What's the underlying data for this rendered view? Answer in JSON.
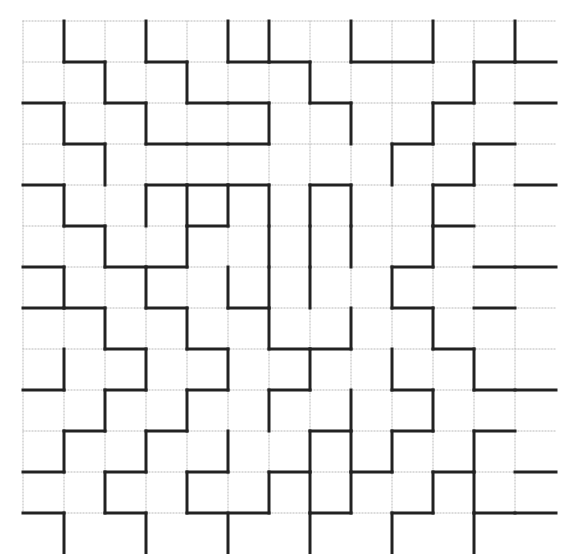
{
  "figure": {
    "kind": "maze-grid-pattern",
    "title": "",
    "caption": "",
    "background_color": "#ffffff",
    "wall_color": "#222222",
    "grid_color": "#b9b9b9",
    "wall_width": 3,
    "grid_width": 1,
    "grid_dash": "1,2"
  },
  "geometry": {
    "origin_x": 23,
    "origin_y": 21,
    "cell": 41,
    "cols": 12,
    "rows": 12,
    "width": 574,
    "height": 554
  },
  "grid_lines": {
    "vertical_x": [
      23,
      64,
      105,
      146,
      187,
      228,
      269,
      310,
      351,
      392,
      433,
      474,
      515
    ],
    "horizontal_y": [
      21,
      62,
      103,
      144,
      185,
      226,
      267,
      308,
      349,
      390,
      431,
      472,
      513
    ]
  },
  "walls": {
    "note": "Each segment is [x1,y1,x2,y2] in pixel coordinates; thick dark strokes forming the maze.",
    "segments": [
      [
        64,
        21,
        64,
        62
      ],
      [
        146,
        21,
        146,
        62
      ],
      [
        228,
        21,
        228,
        62
      ],
      [
        269,
        21,
        269,
        62
      ],
      [
        351,
        21,
        351,
        62
      ],
      [
        433,
        21,
        433,
        62
      ],
      [
        515,
        21,
        515,
        62
      ],
      [
        64,
        62,
        105,
        62
      ],
      [
        146,
        62,
        187,
        62
      ],
      [
        228,
        62,
        269,
        62
      ],
      [
        269,
        62,
        310,
        62
      ],
      [
        351,
        62,
        433,
        62
      ],
      [
        474,
        62,
        515,
        62
      ],
      [
        515,
        62,
        556,
        62
      ],
      [
        105,
        62,
        105,
        103
      ],
      [
        187,
        62,
        187,
        103
      ],
      [
        310,
        62,
        310,
        103
      ],
      [
        474,
        62,
        474,
        103
      ],
      [
        23,
        103,
        64,
        103
      ],
      [
        105,
        103,
        146,
        103
      ],
      [
        187,
        103,
        228,
        103
      ],
      [
        228,
        103,
        269,
        103
      ],
      [
        310,
        103,
        351,
        103
      ],
      [
        433,
        103,
        474,
        103
      ],
      [
        515,
        103,
        556,
        103
      ],
      [
        64,
        103,
        64,
        144
      ],
      [
        146,
        103,
        146,
        144
      ],
      [
        269,
        103,
        269,
        144
      ],
      [
        351,
        103,
        351,
        144
      ],
      [
        433,
        103,
        433,
        144
      ],
      [
        64,
        144,
        105,
        144
      ],
      [
        146,
        144,
        187,
        144
      ],
      [
        187,
        144,
        228,
        144
      ],
      [
        228,
        144,
        269,
        144
      ],
      [
        392,
        144,
        433,
        144
      ],
      [
        474,
        144,
        515,
        144
      ],
      [
        105,
        144,
        105,
        185
      ],
      [
        392,
        144,
        392,
        185
      ],
      [
        474,
        144,
        474,
        185
      ],
      [
        23,
        185,
        64,
        185
      ],
      [
        146,
        185,
        187,
        185
      ],
      [
        187,
        185,
        228,
        185
      ],
      [
        228,
        185,
        269,
        185
      ],
      [
        310,
        185,
        351,
        185
      ],
      [
        433,
        185,
        474,
        185
      ],
      [
        515,
        185,
        556,
        185
      ],
      [
        64,
        185,
        64,
        226
      ],
      [
        146,
        185,
        146,
        226
      ],
      [
        269,
        185,
        269,
        226
      ],
      [
        310,
        185,
        310,
        226
      ],
      [
        351,
        185,
        351,
        226
      ],
      [
        433,
        185,
        433,
        226
      ],
      [
        187,
        185,
        187,
        226
      ],
      [
        228,
        185,
        228,
        226
      ],
      [
        64,
        226,
        105,
        226
      ],
      [
        187,
        226,
        228,
        226
      ],
      [
        433,
        226,
        474,
        226
      ],
      [
        105,
        226,
        105,
        267
      ],
      [
        187,
        226,
        187,
        267
      ],
      [
        269,
        226,
        269,
        267
      ],
      [
        310,
        226,
        310,
        267
      ],
      [
        351,
        226,
        351,
        267
      ],
      [
        433,
        226,
        433,
        267
      ],
      [
        23,
        267,
        64,
        267
      ],
      [
        105,
        267,
        146,
        267
      ],
      [
        146,
        267,
        187,
        267
      ],
      [
        392,
        267,
        433,
        267
      ],
      [
        474,
        267,
        515,
        267
      ],
      [
        515,
        267,
        556,
        267
      ],
      [
        64,
        267,
        64,
        308
      ],
      [
        146,
        267,
        146,
        308
      ],
      [
        228,
        267,
        228,
        308
      ],
      [
        269,
        267,
        269,
        308
      ],
      [
        310,
        267,
        310,
        308
      ],
      [
        392,
        267,
        392,
        308
      ],
      [
        23,
        308,
        64,
        308
      ],
      [
        64,
        308,
        105,
        308
      ],
      [
        146,
        308,
        187,
        308
      ],
      [
        228,
        308,
        269,
        308
      ],
      [
        392,
        308,
        433,
        308
      ],
      [
        474,
        308,
        515,
        308
      ],
      [
        105,
        308,
        105,
        349
      ],
      [
        187,
        308,
        187,
        349
      ],
      [
        269,
        308,
        269,
        349
      ],
      [
        351,
        308,
        351,
        349
      ],
      [
        433,
        308,
        433,
        349
      ],
      [
        105,
        349,
        146,
        349
      ],
      [
        187,
        349,
        228,
        349
      ],
      [
        269,
        349,
        310,
        349
      ],
      [
        310,
        349,
        351,
        349
      ],
      [
        433,
        349,
        474,
        349
      ],
      [
        64,
        349,
        64,
        390
      ],
      [
        146,
        349,
        146,
        390
      ],
      [
        228,
        349,
        228,
        390
      ],
      [
        310,
        349,
        310,
        390
      ],
      [
        392,
        349,
        392,
        390
      ],
      [
        474,
        349,
        474,
        390
      ],
      [
        23,
        390,
        64,
        390
      ],
      [
        105,
        390,
        146,
        390
      ],
      [
        187,
        390,
        228,
        390
      ],
      [
        269,
        390,
        310,
        390
      ],
      [
        392,
        390,
        433,
        390
      ],
      [
        474,
        390,
        515,
        390
      ],
      [
        515,
        390,
        556,
        390
      ],
      [
        105,
        390,
        105,
        431
      ],
      [
        187,
        390,
        187,
        431
      ],
      [
        269,
        390,
        269,
        431
      ],
      [
        351,
        390,
        351,
        431
      ],
      [
        433,
        390,
        433,
        431
      ],
      [
        64,
        431,
        105,
        431
      ],
      [
        146,
        431,
        187,
        431
      ],
      [
        310,
        431,
        351,
        431
      ],
      [
        392,
        431,
        433,
        431
      ],
      [
        474,
        431,
        515,
        431
      ],
      [
        64,
        431,
        64,
        472
      ],
      [
        146,
        431,
        146,
        472
      ],
      [
        228,
        431,
        228,
        472
      ],
      [
        310,
        431,
        310,
        472
      ],
      [
        351,
        431,
        351,
        472
      ],
      [
        392,
        431,
        392,
        472
      ],
      [
        474,
        431,
        474,
        472
      ],
      [
        23,
        472,
        64,
        472
      ],
      [
        105,
        472,
        146,
        472
      ],
      [
        187,
        472,
        228,
        472
      ],
      [
        269,
        472,
        310,
        472
      ],
      [
        351,
        472,
        392,
        472
      ],
      [
        433,
        472,
        474,
        472
      ],
      [
        515,
        472,
        556,
        472
      ],
      [
        105,
        472,
        105,
        513
      ],
      [
        187,
        472,
        187,
        513
      ],
      [
        269,
        472,
        269,
        513
      ],
      [
        310,
        472,
        310,
        513
      ],
      [
        351,
        472,
        351,
        513
      ],
      [
        433,
        472,
        433,
        513
      ],
      [
        474,
        472,
        474,
        513
      ],
      [
        64,
        513,
        64,
        554
      ],
      [
        146,
        513,
        146,
        554
      ],
      [
        228,
        513,
        228,
        554
      ],
      [
        310,
        513,
        310,
        554
      ],
      [
        392,
        513,
        392,
        554
      ],
      [
        474,
        513,
        474,
        554
      ],
      [
        23,
        513,
        64,
        513
      ],
      [
        105,
        513,
        146,
        513
      ],
      [
        187,
        513,
        269,
        513
      ],
      [
        310,
        513,
        351,
        513
      ],
      [
        392,
        513,
        433,
        513
      ],
      [
        474,
        513,
        515,
        513
      ],
      [
        515,
        513,
        556,
        513
      ]
    ]
  }
}
